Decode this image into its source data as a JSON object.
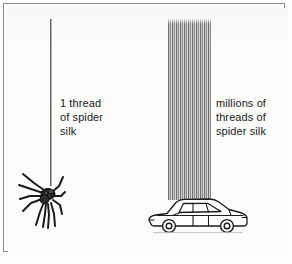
{
  "figure": {
    "frame_color": "#8d8f8e",
    "background_color": "#fafaf9",
    "labels": {
      "left": "1 thread\nof spider\nsilk",
      "right": "millions of\nthreads of\nspider silk"
    },
    "elements": {
      "single_thread_name": "single-silk-thread",
      "thread_bundle_name": "silk-thread-bundle",
      "spider_name": "spider-illustration",
      "car_name": "car-illustration"
    },
    "colors": {
      "thread_dark": "#5c5c5c",
      "thread_light": "#c9c9c9",
      "ink": "#1b1b1b"
    }
  }
}
